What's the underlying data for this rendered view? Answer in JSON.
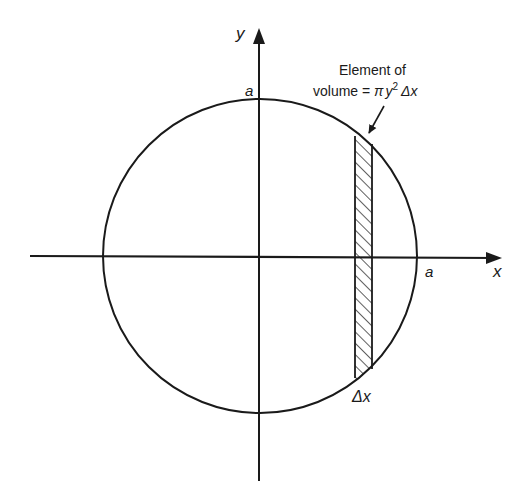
{
  "diagram": {
    "type": "circle-volume-element",
    "axes": {
      "x_label": "x",
      "y_label": "y"
    },
    "intercept_labels": {
      "x_intercept": "a",
      "y_intercept": "a"
    },
    "annotation": {
      "line1": "Element of",
      "line2_prefix": "volume = ",
      "pi": "π",
      "y": "y",
      "exponent": "2",
      "delta_x": "Δx"
    },
    "strip_label": "Δx",
    "colors": {
      "ink": "#1a1a1a",
      "background": "#ffffff"
    }
  }
}
